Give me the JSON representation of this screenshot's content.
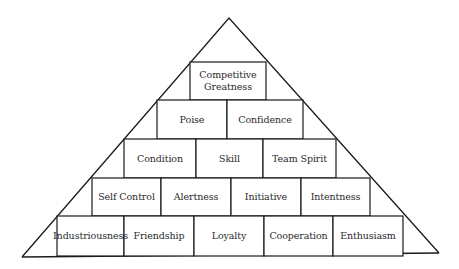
{
  "diagram": {
    "type": "pyramid",
    "colors": {
      "stroke": "#1a1a1a",
      "fill": "#ffffff",
      "text": "#2a2a2a"
    },
    "tiers": [
      {
        "level": 1,
        "blocks": [
          "Competitive\nGreatness"
        ]
      },
      {
        "level": 2,
        "blocks": [
          "Poise",
          "Confidence"
        ]
      },
      {
        "level": 3,
        "blocks": [
          "Condition",
          "Skill",
          "Team Spirit"
        ]
      },
      {
        "level": 4,
        "blocks": [
          "Self Control",
          "Alertness",
          "Initiative",
          "Intentness"
        ]
      },
      {
        "level": 5,
        "blocks": [
          "Industriousness",
          "Friendship",
          "Loyalty",
          "Cooperation",
          "Enthusiasm"
        ]
      }
    ]
  }
}
